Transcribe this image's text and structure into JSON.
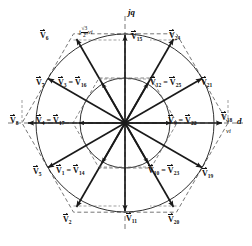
{
  "figure": {
    "type": "space-vector-diagram",
    "title": "",
    "center": {
      "x": 125,
      "y": 123
    },
    "axes": {
      "vertical_label": "jq",
      "horizontal_label": "d",
      "horizontal_unit_label": "vi",
      "vertical_annotation_prefix": "j",
      "vertical_annotation_num": "√3",
      "vertical_annotation_den": "2",
      "vertical_annotation_suffix": "vi"
    },
    "geometry": {
      "outer_radius": 103,
      "inner_radius": 52,
      "outer_circle_radius": 89,
      "inner_circle_radius": 45,
      "hexagon_dashed": true,
      "num_long_vectors": 6,
      "num_medium_vectors": 6,
      "total_labeled_vectors": 24
    },
    "vectors": [
      {
        "name": "V6",
        "angle_deg": 120,
        "length": "long",
        "label_x": 40,
        "label_y": 32
      },
      {
        "name": "V15",
        "angle_deg": 90,
        "length": "medium",
        "label_x": 131,
        "label_y": 33
      },
      {
        "name": "V24",
        "angle_deg": 60,
        "length": "long",
        "label_x": 169,
        "label_y": 32
      },
      {
        "name": "V7",
        "angle_deg": 150,
        "length": "long",
        "label_x": 36,
        "label_y": 79
      },
      {
        "name": "V3 = V16",
        "angle_deg": 120,
        "length": "medium",
        "label_x": 64,
        "label_y": 79
      },
      {
        "name": "V12 = V25",
        "angle_deg": 60,
        "length": "medium",
        "label_x": 155,
        "label_y": 79
      },
      {
        "name": "V21",
        "angle_deg": 30,
        "length": "long",
        "label_x": 201,
        "label_y": 79
      },
      {
        "name": "V8",
        "angle_deg": 180,
        "length": "long",
        "label_x": 11,
        "label_y": 119
      },
      {
        "name": "V4 = V17",
        "angle_deg": 180,
        "length": "medium",
        "label_x": 42,
        "label_y": 119
      },
      {
        "name": "V9 = V22",
        "angle_deg": 0,
        "length": "medium",
        "label_x": 172,
        "label_y": 119
      },
      {
        "name": "V18",
        "angle_deg": 0,
        "length": "long",
        "label_x": 222,
        "label_y": 119
      },
      {
        "name": "V5",
        "angle_deg": 210,
        "length": "long",
        "label_x": 33,
        "label_y": 168
      },
      {
        "name": "V1 = V14",
        "angle_deg": 240,
        "length": "medium",
        "label_x": 61,
        "label_y": 168
      },
      {
        "name": "V10 = V23",
        "angle_deg": 300,
        "length": "medium",
        "label_x": 152,
        "label_y": 168
      },
      {
        "name": "V19",
        "angle_deg": 330,
        "length": "long",
        "label_x": 202,
        "label_y": 170
      },
      {
        "name": "V2",
        "angle_deg": 240,
        "length": "long",
        "label_x": 63,
        "label_y": 216
      },
      {
        "name": "V11",
        "angle_deg": 270,
        "length": "medium",
        "label_x": 128,
        "label_y": 215
      },
      {
        "name": "V20",
        "angle_deg": 300,
        "length": "long",
        "label_x": 168,
        "label_y": 216
      }
    ],
    "labels": [
      {
        "id": "v6",
        "base": "V",
        "sub": "6",
        "x": 40,
        "y": 32
      },
      {
        "id": "v15",
        "base": "V",
        "sub": "15",
        "x": 131,
        "y": 33
      },
      {
        "id": "v24",
        "base": "V",
        "sub": "24",
        "x": 169,
        "y": 32
      },
      {
        "id": "v7",
        "base": "V",
        "sub": "7",
        "x": 36,
        "y": 79
      },
      {
        "id": "v3",
        "base": "V",
        "sub": "3",
        "base2": "V",
        "sub2": "16",
        "x": 64,
        "y": 79
      },
      {
        "id": "v12",
        "base": "V",
        "sub": "12",
        "base2": "V",
        "sub2": "25",
        "x": 155,
        "y": 79
      },
      {
        "id": "v21",
        "base": "V",
        "sub": "21",
        "x": 201,
        "y": 79
      },
      {
        "id": "v8",
        "base": "V",
        "sub": "8",
        "x": 11,
        "y": 119
      },
      {
        "id": "v4",
        "base": "V",
        "sub": "4",
        "base2": "V",
        "sub2": "17",
        "x": 42,
        "y": 119
      },
      {
        "id": "v9",
        "base": "V",
        "sub": "9",
        "base2": "V",
        "sub2": "22",
        "x": 172,
        "y": 119
      },
      {
        "id": "v18",
        "base": "V",
        "sub": "18",
        "x": 222,
        "y": 115
      },
      {
        "id": "v5",
        "base": "V",
        "sub": "5",
        "x": 33,
        "y": 168
      },
      {
        "id": "v1",
        "base": "V",
        "sub": "1",
        "base2": "V",
        "sub2": "14",
        "x": 61,
        "y": 168
      },
      {
        "id": "v10",
        "base": "V",
        "sub": "10",
        "base2": "V",
        "sub2": "23",
        "x": 152,
        "y": 168
      },
      {
        "id": "v19",
        "base": "V",
        "sub": "19",
        "x": 202,
        "y": 170
      },
      {
        "id": "v2",
        "base": "V",
        "sub": "2",
        "x": 63,
        "y": 216
      },
      {
        "id": "v11",
        "base": "V",
        "sub": "11",
        "x": 128,
        "y": 215
      },
      {
        "id": "v20",
        "base": "V",
        "sub": "20",
        "x": 168,
        "y": 216
      }
    ],
    "colors": {
      "stroke": "#1a1a1a",
      "dashed": "#555555",
      "background": "#ffffff",
      "text": "#101010"
    }
  }
}
